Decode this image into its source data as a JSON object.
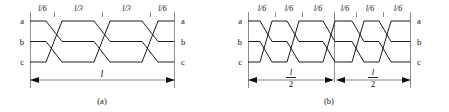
{
  "figure": {
    "type": "transmission-line-transposition-diagram",
    "phases": [
      "a",
      "b",
      "c"
    ],
    "panels": [
      {
        "id": "a",
        "caption": "(a)",
        "left_phase_labels": [
          "a",
          "b",
          "c"
        ],
        "right_phase_labels": [
          "a",
          "b",
          "c"
        ],
        "segment_labels": [
          "l/6",
          "l/3",
          "l/3",
          "l/6"
        ],
        "segment_label_parts": [
          {
            "num": "l",
            "sep": "/",
            "den": "6"
          },
          {
            "num": "l",
            "sep": "/",
            "den": "3"
          },
          {
            "num": "l",
            "sep": "/",
            "den": "3"
          },
          {
            "num": "l",
            "sep": "/",
            "den": "6"
          }
        ],
        "dimensions": [
          {
            "label": "l",
            "is_fraction": false,
            "numerator": "l",
            "denominator": ""
          }
        ]
      },
      {
        "id": "b",
        "caption": "(b)",
        "left_phase_labels": [
          "a",
          "b",
          "c"
        ],
        "right_phase_labels": [
          "a",
          "b",
          "c"
        ],
        "segment_labels": [
          "l/6",
          "l/6",
          "l/6",
          "l/6",
          "l/6",
          "l/6"
        ],
        "segment_label_parts": [
          {
            "num": "l",
            "sep": "/",
            "den": "6"
          },
          {
            "num": "l",
            "sep": "/",
            "den": "6"
          },
          {
            "num": "l",
            "sep": "/",
            "den": "6"
          },
          {
            "num": "l",
            "sep": "/",
            "den": "6"
          },
          {
            "num": "l",
            "sep": "/",
            "den": "6"
          },
          {
            "num": "l",
            "sep": "/",
            "den": "6"
          }
        ],
        "dimensions": [
          {
            "label": "l/2",
            "is_fraction": true,
            "numerator": "l",
            "denominator": "2"
          },
          {
            "label": "l/2",
            "is_fraction": true,
            "numerator": "l",
            "denominator": "2"
          }
        ]
      }
    ],
    "colors": {
      "conductor": "#1a1a1a",
      "rail": "#8c8c8c",
      "dimension": "#8c8c8c",
      "text": "#111111",
      "background": "#ffffff"
    }
  }
}
